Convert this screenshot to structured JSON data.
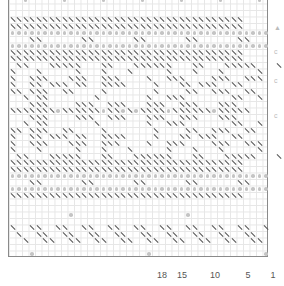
{
  "chart": {
    "columns": 40,
    "cell_px": 6.5,
    "symbol_legend": {
      ".": "empty",
      "\\": "slash-stitch",
      "o": "dot-stitch"
    },
    "rows": [
      "..o.....o.....o.....o.....o.....o.....o.",
      "........................................",
      "........................................",
      "\\\\\\\\\\\\\\\\\\\\\\\\\\\\\\\\\\\\\\\\\\\\\\\\\\\\\\\\\\\\\\\\\\\\\\\\",
      "\\\\\\\\\\\\\\\\\\\\\\\\\\\\\\\\\\\\\\\\\\\\\\\\\\\\\\\\\\\\\\\\\\\\\\\\",
      "oooooooooooooooooooooooooooooooooooooooo",
      "...\\\\......\\\\......\\\\......\\\\......\\\\...",
      "oooooooooooooooooooooooooooooooooooooooo",
      "\\\\\\\\\\\\\\\\\\\\\\\\\\\\\\\\\\\\\\\\\\\\\\\\\\\\\\\\\\\\\\\\\\\\\\\\",
      "\\\\\\\\\\\\\\\\\\\\\\\\\\\\\\\\\\\\\\\\\\\\\\\\\\\\\\\\\\\\\\\\\\\\\\\\",
      ".\\\\...\\\\\\\\\\...\\\\...\\\\\\\\\\\\...\\\\...\\\\\\\\\\...\\",
      "\\...\\.....\\...\\...\\.....\\...\\...\\.....\\..",
      "\\..\\\\\\...\\\\\\..\\\\\\....\\..\\\\\\....\\\\\\..\\\\\\.",
      "\\..\\\\.\\\\\\.\\\\..\\\\\\\\....\\...\\\\.\\\\\\..\\\\..",
      "\\\\.\\\\\\..\\\\....\\.......\\....\\\\..\\\\\\..\\\\",
      "..\\.\\\\.......\\.......\\..\\\\\\.......\\\\..\\",
      "...\\\\\\....\\\\\\..\\\\\\...\\\\\\..\\\\\\...\\\\\\....",
      "\\\\\\\\\\\\\\o\\\\\\\\\\\\o\\\\o\\o\\\\\\\\o\\\\\\\\\\\\o\\\\\\\\\\",
      "...\\\\\\....\\\\\\..\\\\\\...\\\\\\..\\\\\\...\\\\\\....",
      "..\\.\\\\.......\\.......\\..\\\\\\.......\\\\..\\",
      "\\\\.\\\\\\..\\\\....\\.......\\....\\\\..\\\\\\..\\\\",
      "\\..\\\\.\\\\\\.\\\\..\\\\\\\\....\\...\\\\.\\\\\\..\\\\..",
      "\\..\\\\\\...\\\\\\..\\\\\\....\\..\\\\\\....\\\\\\..\\\\\\.",
      "\\...\\.....\\...\\...\\.....\\...\\...\\.....\\..",
      ".\\\\...\\\\\\\\\\...\\\\...\\\\\\\\\\\\...\\\\...\\\\\\\\\\...\\",
      "\\\\\\\\\\\\\\\\\\\\\\\\\\\\\\\\\\\\\\\\\\\\\\\\\\\\\\\\\\\\\\\\\\\\\\\\",
      "\\\\\\\\\\\\\\\\\\\\\\\\\\\\\\\\\\\\\\\\\\\\\\\\\\\\\\\\\\\\\\\\\\\\\\\\",
      "oooooooooooooooooooooooooooooooooooooooo",
      "...\\\\......\\\\......\\\\......\\\\......\\\\...",
      "oooooooooooooooooooooooooooooooooooooooo",
      "\\\\\\\\\\\\\\\\\\\\\\\\\\\\\\\\\\\\\\\\\\\\\\\\\\\\\\\\\\\\\\\\\\\\\\\\",
      "........................................",
      "........................................",
      ".........o.................o............",
      "........................................",
      "\\..\\\\..\\\\..\\\\..\\\\..\\\\..\\\\..\\\\..\\\\..\\\\..\\",
      ".\\..\\\\..\\\\..\\\\..\\\\..\\\\..\\\\..\\\\..\\\\..\\\\..",
      "..\\..\\\\..\\\\..\\\\..\\\\..\\\\..\\\\..\\\\..\\\\..\\\\.",
      "........................................",
      "...o.................o.................o",
      "........................................"
    ]
  },
  "column_labels": [
    {
      "text": "18",
      "x": 162
    },
    {
      "text": "15",
      "x": 182
    },
    {
      "text": "10",
      "x": 215
    },
    {
      "text": "5",
      "x": 248
    },
    {
      "text": "1",
      "x": 273
    }
  ],
  "side_marks": [
    {
      "text": "▲",
      "y": 24
    },
    {
      "text": "c",
      "y": 48
    },
    {
      "text": "c",
      "y": 77
    },
    {
      "text": "c",
      "y": 112
    }
  ]
}
